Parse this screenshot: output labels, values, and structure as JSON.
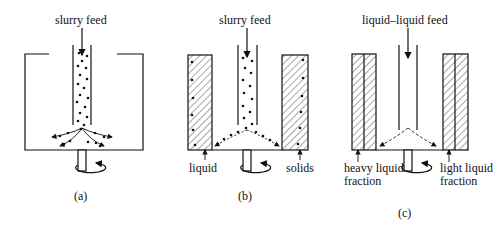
{
  "diagram": {
    "colors": {
      "ink": "#111111",
      "background": "#ffffff"
    },
    "panels": [
      {
        "id": "a",
        "caption": "(a)",
        "feed_label": "slurry feed",
        "type": "basket-open"
      },
      {
        "id": "b",
        "caption": "(b)",
        "feed_label": "slurry feed",
        "type": "solid-liquid",
        "left_label": "liquid",
        "right_label": "solids"
      },
      {
        "id": "c",
        "caption": "(c)",
        "feed_label": "liquid–liquid feed",
        "type": "liquid-liquid",
        "left_label": "heavy liquid fraction",
        "right_label": "light liquid fraction"
      }
    ]
  }
}
